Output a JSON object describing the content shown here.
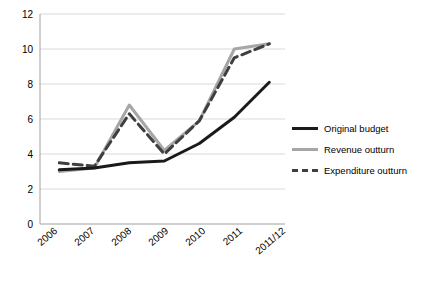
{
  "chart_data": {
    "type": "line",
    "title": "",
    "xlabel": "",
    "ylabel": "",
    "categories": [
      "2006",
      "2007",
      "2008",
      "2009",
      "2010",
      "2011",
      "2011/12"
    ],
    "ylim": [
      0,
      12
    ],
    "yticks": [
      0,
      2,
      4,
      6,
      8,
      10,
      12
    ],
    "grid": "horizontal",
    "legend_position": "right",
    "series": [
      {
        "name": "Original budget",
        "color": "#1a1a1a",
        "style": "solid",
        "width": 3,
        "values": [
          3.1,
          3.2,
          3.5,
          3.6,
          4.6,
          6.1,
          8.1
        ]
      },
      {
        "name": "Revenue outturn",
        "color": "#a6a6a6",
        "style": "solid",
        "width": 3,
        "values": [
          3.0,
          3.2,
          6.8,
          4.2,
          5.9,
          10.0,
          10.3
        ]
      },
      {
        "name": "Expenditure outturn",
        "color": "#3f3f3f",
        "style": "dashed",
        "width": 3,
        "values": [
          3.5,
          3.3,
          6.3,
          4.0,
          5.9,
          9.5,
          10.3
        ]
      }
    ]
  },
  "legend": {
    "items": [
      {
        "label": "Original budget"
      },
      {
        "label": "Revenue outturn"
      },
      {
        "label": "Expenditure outturn"
      }
    ]
  },
  "axis": {
    "y_labels": [
      "12",
      "10",
      "8",
      "6",
      "4",
      "2",
      "0"
    ],
    "x_labels": [
      "2006",
      "2007",
      "2008",
      "2009",
      "2010",
      "2011",
      "2011/12"
    ]
  }
}
